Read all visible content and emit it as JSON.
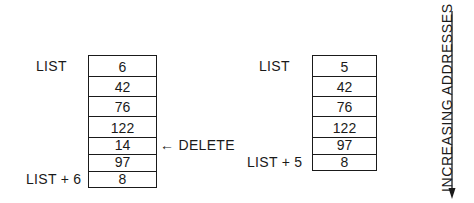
{
  "diagram": {
    "left_list": {
      "start_label": "LIST",
      "end_label": "LIST + 6",
      "cells": [
        "6",
        "42",
        "76",
        "122",
        "14",
        "97",
        "8"
      ],
      "delete_marker": {
        "arrow": "←",
        "text": "DELETE",
        "target_index": 4
      }
    },
    "right_list": {
      "start_label": "LIST",
      "end_label": "LIST + 5",
      "cells": [
        "5",
        "42",
        "76",
        "122",
        "97",
        "8"
      ]
    },
    "axis": {
      "label": "INCREASING ADDRESSES",
      "direction": "down"
    },
    "colors": {
      "ink": "#1a1a1a",
      "background": "#ffffff"
    }
  }
}
